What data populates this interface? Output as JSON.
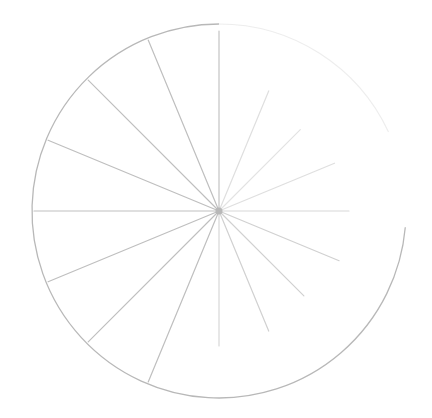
{
  "diagram": {
    "type": "radial-spoke-circle",
    "center": [
      219,
      211
    ],
    "radius": 187,
    "stroke_color": "#b8b8b8",
    "background": "#ffffff",
    "spoke_count": 16,
    "spokes": [
      {
        "angle": -90,
        "length": 180,
        "opacity": 0.85
      },
      {
        "angle": -67.5,
        "length": 130,
        "opacity": 0.45
      },
      {
        "angle": -45,
        "length": 115,
        "opacity": 0.4
      },
      {
        "angle": -22.5,
        "length": 125,
        "opacity": 0.45
      },
      {
        "angle": 0,
        "length": 130,
        "opacity": 0.55
      },
      {
        "angle": 22.5,
        "length": 130,
        "opacity": 0.65
      },
      {
        "angle": 45,
        "length": 120,
        "opacity": 0.65
      },
      {
        "angle": 67.5,
        "length": 130,
        "opacity": 0.65
      },
      {
        "angle": 90,
        "length": 135,
        "opacity": 0.55
      },
      {
        "angle": 112.5,
        "length": 185,
        "opacity": 0.9
      },
      {
        "angle": 135,
        "length": 185,
        "opacity": 0.9
      },
      {
        "angle": 157.5,
        "length": 185,
        "opacity": 0.9
      },
      {
        "angle": 180,
        "length": 185,
        "opacity": 0.9
      },
      {
        "angle": 202.5,
        "length": 185,
        "opacity": 0.9
      },
      {
        "angle": 225,
        "length": 185,
        "opacity": 0.9
      },
      {
        "angle": 247.5,
        "length": 185,
        "opacity": 0.9
      }
    ],
    "arc_solid": {
      "start_angle": 5,
      "end_angle": 270
    },
    "arc_faded": {
      "start_angle": 270,
      "end_angle": 335,
      "opacity": 0.25
    }
  }
}
